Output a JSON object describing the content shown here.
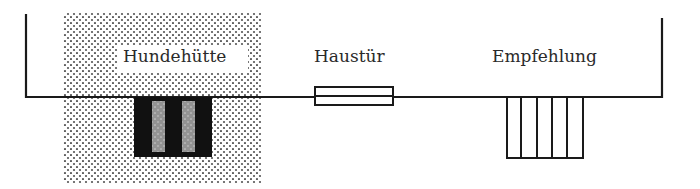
{
  "diagram": {
    "labels": {
      "hundehuette": "Hundehütte",
      "haustuer": "Haustür",
      "empfehlung": "Empfehlung"
    },
    "colors": {
      "line": "#1a1a1a",
      "dot": "#555555",
      "background": "#ffffff"
    }
  }
}
